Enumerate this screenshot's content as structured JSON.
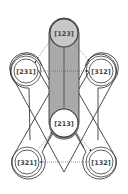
{
  "diagram": {
    "type": "state-transition-graph",
    "colors": {
      "background": "#ffffff",
      "stroke": "#3a3a3a",
      "highlight_fill": "#a9a9a9",
      "node_fill": "#ffffff",
      "highlight_node_fill": "#c8c8c8",
      "label": "#444444"
    },
    "nodes": [
      {
        "id": "n123",
        "label": "[123]",
        "x": 64,
        "y": 33,
        "highlighted": true
      },
      {
        "id": "n231",
        "label": "[231]",
        "x": 26,
        "y": 71,
        "highlighted": false
      },
      {
        "id": "n312",
        "label": "[312]",
        "x": 101,
        "y": 71,
        "highlighted": false
      },
      {
        "id": "n213",
        "label": "[213]",
        "x": 64,
        "y": 123,
        "highlighted": true
      },
      {
        "id": "n321",
        "label": "[321]",
        "x": 27,
        "y": 162,
        "highlighted": false
      },
      {
        "id": "n132",
        "label": "[132]",
        "x": 101,
        "y": 162,
        "highlighted": false
      }
    ],
    "edges": [
      {
        "from": "[231]",
        "to": "[123]",
        "style": "dotted"
      },
      {
        "from": "[123]",
        "to": "[312]",
        "style": "dotted"
      },
      {
        "from": "[231]",
        "to": "[312]",
        "style": "dotted"
      },
      {
        "from": "[321]",
        "to": "[213]",
        "style": "dotted"
      },
      {
        "from": "[213]",
        "to": "[132]",
        "style": "dotted"
      },
      {
        "from": "[132]",
        "to": "[321]",
        "style": "dotted"
      },
      {
        "from": "[123]",
        "to": "[213]",
        "style": "solid"
      }
    ]
  }
}
